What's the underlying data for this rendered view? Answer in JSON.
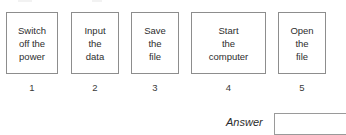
{
  "worksheet": {
    "steps": [
      {
        "number": "1",
        "lines": [
          "Switch",
          "off the",
          "power"
        ],
        "x": 6,
        "width": 52
      },
      {
        "number": "2",
        "lines": [
          "Input",
          "the",
          "data"
        ],
        "x": 71,
        "width": 48
      },
      {
        "number": "3",
        "lines": [
          "Save",
          "the",
          "file"
        ],
        "x": 131,
        "width": 48
      },
      {
        "number": "4",
        "lines": [
          "Start",
          "the",
          "computer"
        ],
        "x": 191,
        "width": 75
      },
      {
        "number": "5",
        "lines": [
          "Open",
          "the",
          "file"
        ],
        "x": 278,
        "width": 48
      }
    ],
    "answer": {
      "label": "Answer",
      "value": "",
      "placeholder": ""
    },
    "colors": {
      "box_border": "#8d8d8d",
      "text": "#2e2e2e",
      "field_border": "#9a9a9a",
      "background": "#ffffff"
    }
  }
}
